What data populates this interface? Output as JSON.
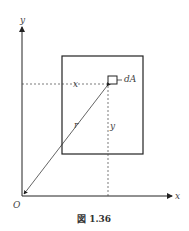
{
  "diagram": {
    "axis_y_label": "y",
    "axis_x_label": "x",
    "origin_label": "O",
    "element_label": "dA",
    "dist_x_label": "x",
    "dist_y_label": "y",
    "radius_label": "r",
    "caption": "図 1.36"
  }
}
